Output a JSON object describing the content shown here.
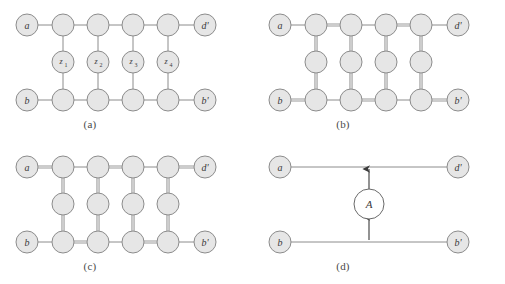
{
  "figure": {
    "type": "diagram",
    "width": 505,
    "height": 284,
    "background_color": "#ffffff",
    "node_fill": "#e6e6e6",
    "node_stroke": "#8c8c8c",
    "edge_color": "#8c8c8c",
    "highlight_color": "#9a9a9a",
    "label_color": "#3a3a3a"
  },
  "panels": [
    {
      "id": "a",
      "caption": "(a)",
      "terminals": {
        "top_left": "a",
        "top_right": "d'",
        "bottom_left": "b",
        "bottom_right": "b'"
      },
      "middle_labels": [
        "z",
        "z",
        "z",
        "z"
      ],
      "middle_subscripts": [
        "1",
        "2",
        "3",
        "4"
      ],
      "columns": 4,
      "rows": [
        "top",
        "middle",
        "bottom"
      ],
      "highlighted_top": [],
      "highlighted_bottom": [],
      "highlighted_vertical": [],
      "show_middle_labels": true
    },
    {
      "id": "b",
      "caption": "(b)",
      "terminals": {
        "top_left": "a",
        "top_right": "d'",
        "bottom_left": "b",
        "bottom_right": "b'"
      },
      "middle_labels": [
        "",
        "",
        "",
        ""
      ],
      "middle_subscripts": [
        "",
        "",
        "",
        ""
      ],
      "columns": 4,
      "rows": [
        "top",
        "middle",
        "bottom"
      ],
      "highlighted_top": [
        1,
        3
      ],
      "highlighted_bottom": [
        0,
        2,
        4
      ],
      "highlighted_vertical": [
        0,
        1,
        2,
        3
      ],
      "show_middle_labels": false
    },
    {
      "id": "c",
      "caption": "(c)",
      "terminals": {
        "top_left": "a",
        "top_right": "d'",
        "bottom_left": "b",
        "bottom_right": "b'"
      },
      "middle_labels": [
        "",
        "",
        "",
        ""
      ],
      "middle_subscripts": [
        "",
        "",
        "",
        ""
      ],
      "columns": 4,
      "rows": [
        "top",
        "middle",
        "bottom"
      ],
      "highlighted_top": [
        0,
        2,
        4
      ],
      "highlighted_bottom": [
        1,
        3
      ],
      "highlighted_vertical": [
        0,
        1,
        2,
        3
      ],
      "show_middle_labels": false
    },
    {
      "id": "d",
      "caption": "(d)",
      "terminals": {
        "top_left": "a",
        "top_right": "d'",
        "bottom_left": "b",
        "bottom_right": "b'"
      },
      "gadget_label": "A",
      "arrows": [
        "up",
        "down"
      ]
    }
  ]
}
